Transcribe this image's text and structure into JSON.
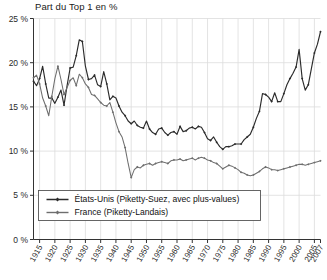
{
  "chart_data": {
    "type": "line",
    "title": "Part du Top 1 en %",
    "xlabel": "",
    "ylabel": "",
    "xlim": [
      1913,
      2007
    ],
    "ylim": [
      0,
      25
    ],
    "grid": true,
    "legend_position": "bottom-left",
    "y_ticks": [
      0,
      5,
      10,
      15,
      20,
      25
    ],
    "y_tick_labels": [
      "0 %",
      "5 %",
      "10 %",
      "15 %",
      "20 %",
      "25 %"
    ],
    "x_ticks": [
      1915,
      1920,
      1925,
      1930,
      1935,
      1940,
      1945,
      1950,
      1955,
      1960,
      1965,
      1970,
      1975,
      1980,
      1985,
      1990,
      1995,
      2000,
      2005,
      2007
    ],
    "x_tick_labels": [
      "1915",
      "1920",
      "1925",
      "1930",
      "1935",
      "1940",
      "1945",
      "1950",
      "1955",
      "1960",
      "1965",
      "1970",
      "1975",
      "1980",
      "1985",
      "1990",
      "1995",
      "2000",
      "2005",
      "2007"
    ],
    "series": [
      {
        "name": "États-Unis (Piketty-Suez, avec plus-values)",
        "color": "#2b2b2b",
        "marker": "diamond",
        "x": [
          1913,
          1914,
          1915,
          1916,
          1917,
          1918,
          1919,
          1920,
          1921,
          1922,
          1923,
          1924,
          1925,
          1926,
          1927,
          1928,
          1929,
          1930,
          1931,
          1932,
          1933,
          1934,
          1935,
          1936,
          1937,
          1938,
          1939,
          1940,
          1941,
          1942,
          1943,
          1944,
          1945,
          1946,
          1947,
          1948,
          1949,
          1950,
          1951,
          1952,
          1953,
          1954,
          1955,
          1956,
          1957,
          1958,
          1959,
          1960,
          1961,
          1962,
          1963,
          1964,
          1965,
          1966,
          1967,
          1968,
          1969,
          1970,
          1971,
          1972,
          1973,
          1974,
          1975,
          1976,
          1977,
          1978,
          1979,
          1980,
          1981,
          1982,
          1983,
          1984,
          1985,
          1986,
          1987,
          1988,
          1989,
          1990,
          1991,
          1992,
          1993,
          1994,
          1995,
          1996,
          1997,
          1998,
          1999,
          2000,
          2001,
          2002,
          2003,
          2004,
          2005,
          2006,
          2007
        ],
        "y": [
          17.9,
          17.4,
          18.2,
          19.6,
          17.6,
          16.0,
          16.0,
          15.4,
          16.1,
          16.9,
          15.2,
          17.4,
          19.4,
          19.5,
          20.8,
          22.6,
          22.4,
          19.6,
          18.1,
          18.2,
          18.6,
          17.5,
          17.3,
          19.0,
          17.6,
          15.8,
          16.2,
          16.0,
          15.1,
          14.4,
          14.0,
          13.4,
          13.1,
          13.4,
          12.9,
          12.7,
          12.6,
          13.4,
          12.5,
          12.1,
          11.9,
          12.5,
          12.6,
          12.1,
          11.8,
          12.1,
          12.2,
          11.9,
          12.8,
          12.2,
          12.3,
          12.6,
          12.7,
          12.5,
          12.8,
          12.7,
          12.1,
          11.4,
          11.2,
          11.6,
          11.0,
          10.5,
          10.2,
          10.5,
          10.5,
          10.6,
          10.8,
          10.8,
          10.8,
          11.3,
          11.6,
          11.9,
          12.7,
          13.7,
          14.5,
          16.5,
          16.4,
          16.1,
          15.6,
          16.6,
          15.6,
          15.6,
          16.5,
          17.5,
          18.2,
          18.8,
          19.5,
          21.5,
          18.2,
          16.9,
          17.5,
          19.3,
          21.1,
          22.1,
          23.5
        ]
      },
      {
        "name": "France (Piketty-Landais)",
        "color": "#6e6e6e",
        "marker": "diamond",
        "x": [
          1913,
          1914,
          1915,
          1916,
          1917,
          1918,
          1919,
          1920,
          1921,
          1922,
          1923,
          1924,
          1925,
          1926,
          1927,
          1928,
          1929,
          1930,
          1931,
          1932,
          1933,
          1934,
          1935,
          1936,
          1937,
          1938,
          1939,
          1940,
          1941,
          1942,
          1943,
          1944,
          1945,
          1946,
          1947,
          1948,
          1949,
          1950,
          1951,
          1952,
          1953,
          1954,
          1955,
          1956,
          1957,
          1958,
          1959,
          1960,
          1961,
          1962,
          1963,
          1964,
          1965,
          1966,
          1967,
          1968,
          1969,
          1970,
          1971,
          1972,
          1973,
          1974,
          1975,
          1976,
          1977,
          1978,
          1979,
          1980,
          1981,
          1982,
          1983,
          1984,
          1985,
          1986,
          1987,
          1988,
          1989,
          1990,
          1991,
          1992,
          1993,
          1994,
          1995,
          1996,
          1997,
          1998,
          1999,
          2000,
          2001,
          2002,
          2003,
          2004,
          2005,
          2006,
          2007
        ],
        "y": [
          18.3,
          18.6,
          17.6,
          16.0,
          15.1,
          14.0,
          16.2,
          18.2,
          19.6,
          18.1,
          16.4,
          17.2,
          18.0,
          18.3,
          17.4,
          18.7,
          18.3,
          17.6,
          17.2,
          16.4,
          16.3,
          15.9,
          15.5,
          15.2,
          15.1,
          15.5,
          14.4,
          13.2,
          12.2,
          11.6,
          10.4,
          8.6,
          7.0,
          7.9,
          8.2,
          8.1,
          8.4,
          8.5,
          8.6,
          8.4,
          8.6,
          8.7,
          8.8,
          8.7,
          8.6,
          8.9,
          9.0,
          9.0,
          9.1,
          8.9,
          9.0,
          9.1,
          9.2,
          9.0,
          9.2,
          9.3,
          9.2,
          9.0,
          8.9,
          8.7,
          8.6,
          8.3,
          8.0,
          8.2,
          8.4,
          8.3,
          8.1,
          7.9,
          7.6,
          7.5,
          7.3,
          7.2,
          7.3,
          7.5,
          7.7,
          8.0,
          8.2,
          8.1,
          7.9,
          7.9,
          7.8,
          7.9,
          8.0,
          8.1,
          8.2,
          8.3,
          8.4,
          8.5,
          8.5,
          8.4,
          8.5,
          8.6,
          8.7,
          8.8,
          8.9
        ]
      }
    ]
  },
  "legend": {
    "items": [
      {
        "label": "États-Unis (Piketty-Suez, avec plus-values)"
      },
      {
        "label": "France (Piketty-Landais)"
      }
    ]
  }
}
